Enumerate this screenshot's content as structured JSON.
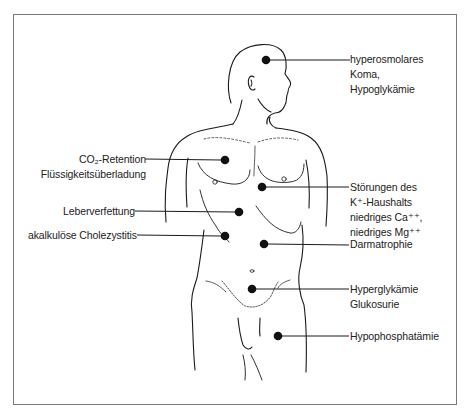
{
  "figure": {
    "frame_color": "#7a7a7a",
    "marker_color": "#111111"
  },
  "annotations": [
    {
      "id": "head",
      "side": "right",
      "lines": [
        "hyperosmolares",
        "Koma,",
        "Hypoglykämie"
      ],
      "dot": [
        266,
        60
      ]
    },
    {
      "id": "lung",
      "side": "left",
      "lines": [
        "CO₂-Retention",
        "Flüssigkeitsüberladung"
      ],
      "dot": [
        225,
        160
      ]
    },
    {
      "id": "heart",
      "side": "right",
      "lines": [
        "Störungen des",
        "K⁺-Haushalts",
        "niedriges Ca⁺⁺,",
        "niedriges Mg⁺⁺"
      ],
      "dot": [
        262,
        187
      ]
    },
    {
      "id": "liver",
      "side": "left",
      "lines": [
        "Leberverfettung"
      ],
      "dot": [
        239,
        212
      ]
    },
    {
      "id": "gallbladder",
      "side": "left",
      "lines": [
        "akalkulöse Cholezystitis"
      ],
      "dot": [
        225,
        236
      ]
    },
    {
      "id": "bowel",
      "side": "right",
      "lines": [
        "Darmatrophie"
      ],
      "dot": [
        264,
        244
      ]
    },
    {
      "id": "pancreas",
      "side": "right",
      "lines": [
        "Hyperglykämie",
        "Glukosurie"
      ],
      "dot": [
        252,
        289
      ]
    },
    {
      "id": "muscle",
      "side": "right",
      "lines": [
        "Hypophosphatämie"
      ],
      "dot": [
        278,
        336
      ]
    }
  ],
  "caption": {
    "text": ""
  }
}
